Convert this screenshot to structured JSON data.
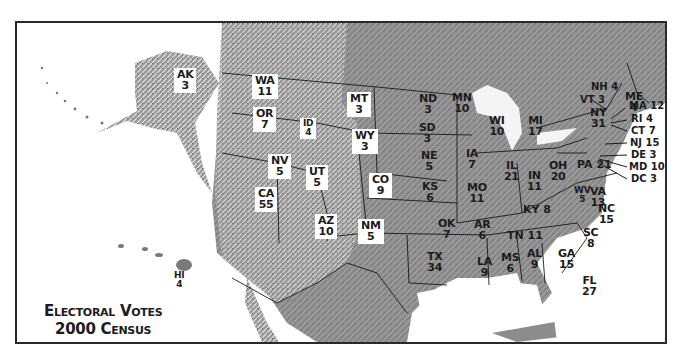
{
  "title": {
    "line1": "Electoral Votes",
    "line2": "2000 Census"
  },
  "colors": {
    "land_relief": "#8a8a8a",
    "land_dark": "#6e6e6e",
    "water": "#ffffff",
    "border": "#1a1a1a",
    "label_box": "#ffffff",
    "text": "#1c1c1c"
  },
  "states": {
    "AK": {
      "abbr": "AK",
      "votes": "3"
    },
    "HI": {
      "abbr": "HI",
      "votes": "4"
    },
    "WA": {
      "abbr": "WA",
      "votes": "11"
    },
    "OR": {
      "abbr": "OR",
      "votes": "7"
    },
    "ID": {
      "abbr": "ID",
      "votes": "4"
    },
    "MT": {
      "abbr": "MT",
      "votes": "3"
    },
    "WY": {
      "abbr": "WY",
      "votes": "3"
    },
    "NV": {
      "abbr": "NV",
      "votes": "5"
    },
    "UT": {
      "abbr": "UT",
      "votes": "5"
    },
    "CO": {
      "abbr": "CO",
      "votes": "9"
    },
    "CA": {
      "abbr": "CA",
      "votes": "55"
    },
    "AZ": {
      "abbr": "AZ",
      "votes": "10"
    },
    "NM": {
      "abbr": "NM",
      "votes": "5"
    },
    "ND": {
      "abbr": "ND",
      "votes": "3"
    },
    "SD": {
      "abbr": "SD",
      "votes": "3"
    },
    "NE": {
      "abbr": "NE",
      "votes": "5"
    },
    "KS": {
      "abbr": "KS",
      "votes": "6"
    },
    "OK": {
      "abbr": "OK",
      "votes": "7"
    },
    "TX": {
      "abbr": "TX",
      "votes": "34"
    },
    "MN": {
      "abbr": "MN",
      "votes": "10"
    },
    "IA": {
      "abbr": "IA",
      "votes": "7"
    },
    "MO": {
      "abbr": "MO",
      "votes": "11"
    },
    "AR": {
      "abbr": "AR",
      "votes": "6"
    },
    "LA": {
      "abbr": "LA",
      "votes": "9"
    },
    "WI": {
      "abbr": "WI",
      "votes": "10"
    },
    "IL": {
      "abbr": "IL",
      "votes": "21"
    },
    "MI": {
      "abbr": "MI",
      "votes": "17"
    },
    "IN": {
      "abbr": "IN",
      "votes": "11"
    },
    "OH": {
      "abbr": "OH",
      "votes": "20"
    },
    "KY": {
      "abbr": "KY",
      "votes": "8"
    },
    "TN": {
      "abbr": "TN",
      "votes": "11"
    },
    "MS": {
      "abbr": "MS",
      "votes": "6"
    },
    "AL": {
      "abbr": "AL",
      "votes": "9"
    },
    "GA": {
      "abbr": "GA",
      "votes": "15"
    },
    "FL": {
      "abbr": "FL",
      "votes": "27"
    },
    "SC": {
      "abbr": "SC",
      "votes": "8"
    },
    "NC": {
      "abbr": "NC",
      "votes": "15"
    },
    "VA": {
      "abbr": "VA",
      "votes": "13"
    },
    "WV": {
      "abbr": "WV",
      "votes": "5"
    },
    "PA": {
      "abbr": "PA",
      "votes": "21"
    },
    "NY": {
      "abbr": "NY",
      "votes": "31"
    },
    "VT": {
      "abbr": "VT",
      "votes": "3"
    },
    "NH": {
      "abbr": "NH",
      "votes": "4"
    },
    "ME": {
      "abbr": "ME",
      "votes": "4"
    }
  },
  "callouts": {
    "MA": "MA 12",
    "RI": "RI 4",
    "CT": "CT 7",
    "NJ": "NJ 15",
    "DE": "DE 3",
    "MD": "MD 10",
    "DC": "DC 3",
    "NH": "NH 4",
    "VT": "VT 3",
    "PA": "PA 21",
    "KY": "KY 8",
    "TN": "TN 11"
  }
}
